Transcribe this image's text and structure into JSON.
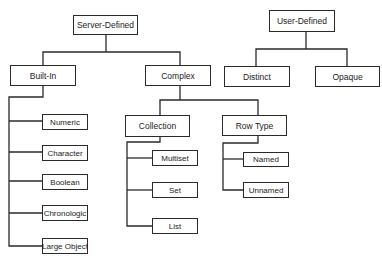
{
  "diagram": {
    "type": "tree",
    "roots": [
      "Server-Defined",
      "User-Defined"
    ],
    "nodes": {
      "server_defined": {
        "label": "Server-Defined",
        "x": 73,
        "y": 15,
        "w": 65,
        "h": 20
      },
      "built_in": {
        "label": "Built-In",
        "x": 10,
        "y": 65,
        "w": 65,
        "h": 21
      },
      "complex": {
        "label": "Complex",
        "x": 145,
        "y": 65,
        "w": 65,
        "h": 21
      },
      "user_defined": {
        "label": "User-Defined",
        "x": 269,
        "y": 10,
        "w": 66,
        "h": 22
      },
      "distinct": {
        "label": "Distinct",
        "x": 224,
        "y": 66,
        "w": 66,
        "h": 21
      },
      "opaque": {
        "label": "Opaque",
        "x": 315,
        "y": 66,
        "w": 65,
        "h": 21
      },
      "numeric": {
        "label": "Numeric",
        "x": 42,
        "y": 114,
        "w": 46,
        "h": 16
      },
      "character": {
        "label": "Character",
        "x": 42,
        "y": 145,
        "w": 46,
        "h": 16
      },
      "boolean": {
        "label": "Boolean",
        "x": 42,
        "y": 174,
        "w": 46,
        "h": 16
      },
      "chronologic": {
        "label": "Chronologic",
        "x": 42,
        "y": 205,
        "w": 46,
        "h": 16
      },
      "large_object": {
        "label": "Large Object",
        "x": 42,
        "y": 238,
        "w": 46,
        "h": 16
      },
      "collection": {
        "label": "Collection",
        "x": 125,
        "y": 115,
        "w": 65,
        "h": 22
      },
      "row_type": {
        "label": "Row Type",
        "x": 222,
        "y": 115,
        "w": 65,
        "h": 21
      },
      "multiset": {
        "label": "Multiset",
        "x": 152,
        "y": 150,
        "w": 46,
        "h": 16
      },
      "set": {
        "label": "Set",
        "x": 152,
        "y": 182,
        "w": 46,
        "h": 16
      },
      "list": {
        "label": "List",
        "x": 152,
        "y": 218,
        "w": 46,
        "h": 16
      },
      "named": {
        "label": "Named",
        "x": 243,
        "y": 152,
        "w": 46,
        "h": 15
      },
      "unnamed": {
        "label": "Unnamed",
        "x": 243,
        "y": 182,
        "w": 46,
        "h": 16
      }
    },
    "edges": [
      [
        "Server-Defined",
        "Built-In"
      ],
      [
        "Server-Defined",
        "Complex"
      ],
      [
        "User-Defined",
        "Distinct"
      ],
      [
        "User-Defined",
        "Opaque"
      ],
      [
        "Built-In",
        "Numeric"
      ],
      [
        "Built-In",
        "Character"
      ],
      [
        "Built-In",
        "Boolean"
      ],
      [
        "Built-In",
        "Chronologic"
      ],
      [
        "Built-In",
        "Large Object"
      ],
      [
        "Complex",
        "Collection"
      ],
      [
        "Complex",
        "Row Type"
      ],
      [
        "Collection",
        "Multiset"
      ],
      [
        "Collection",
        "Set"
      ],
      [
        "Collection",
        "List"
      ],
      [
        "Row Type",
        "Named"
      ],
      [
        "Row Type",
        "Unnamed"
      ]
    ],
    "colors": {
      "line": "#2a2a2a",
      "box_border": "#2a2a2a",
      "background": "#ffffff",
      "text": "#222222"
    }
  }
}
